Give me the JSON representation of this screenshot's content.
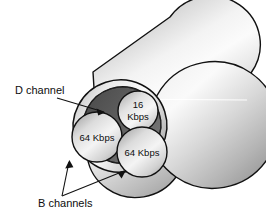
{
  "figure": {
    "background_color": "#ffffff",
    "callouts": [
      {
        "id": "d-channel",
        "text": "D channel"
      },
      {
        "id": "b-channels",
        "text": "B channels"
      }
    ],
    "channels": [
      {
        "id": "d-channel-ring",
        "name": "D channel",
        "rate": "16 Kbps",
        "rate_line1": "16",
        "rate_line2": "Kbps"
      },
      {
        "id": "b-channel-left",
        "name": "B channel",
        "rate": "64 Kbps"
      },
      {
        "id": "b-channel-right",
        "name": "B channel",
        "rate": "64 Kbps"
      }
    ],
    "colors": {
      "outline": "#111111",
      "sheath_light": "#f2f2f2",
      "sheath_mid": "#c8c8c8",
      "sheath_dark": "#8e8e8e",
      "d_channel_fill": "#5d5d5d",
      "core_fill": "#d9d9d9",
      "text": "#0d0d0d",
      "background": "#ffffff"
    }
  }
}
